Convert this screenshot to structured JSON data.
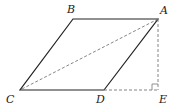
{
  "diagram": {
    "type": "geometry",
    "points": {
      "A": {
        "label": "A",
        "x": 158,
        "y": 19
      },
      "B": {
        "label": "B",
        "x": 73,
        "y": 19
      },
      "C": {
        "label": "C",
        "x": 20,
        "y": 90
      },
      "D": {
        "label": "D",
        "x": 104,
        "y": 90
      },
      "E": {
        "label": "E",
        "x": 158,
        "y": 90
      }
    },
    "solid_segments": [
      "AB",
      "BC",
      "CD",
      "DA"
    ],
    "dashed_segments": [
      "AC",
      "AE",
      "DE"
    ],
    "right_angle_at": "E",
    "colors": {
      "line": "#222222",
      "dashed": "#777777"
    }
  }
}
